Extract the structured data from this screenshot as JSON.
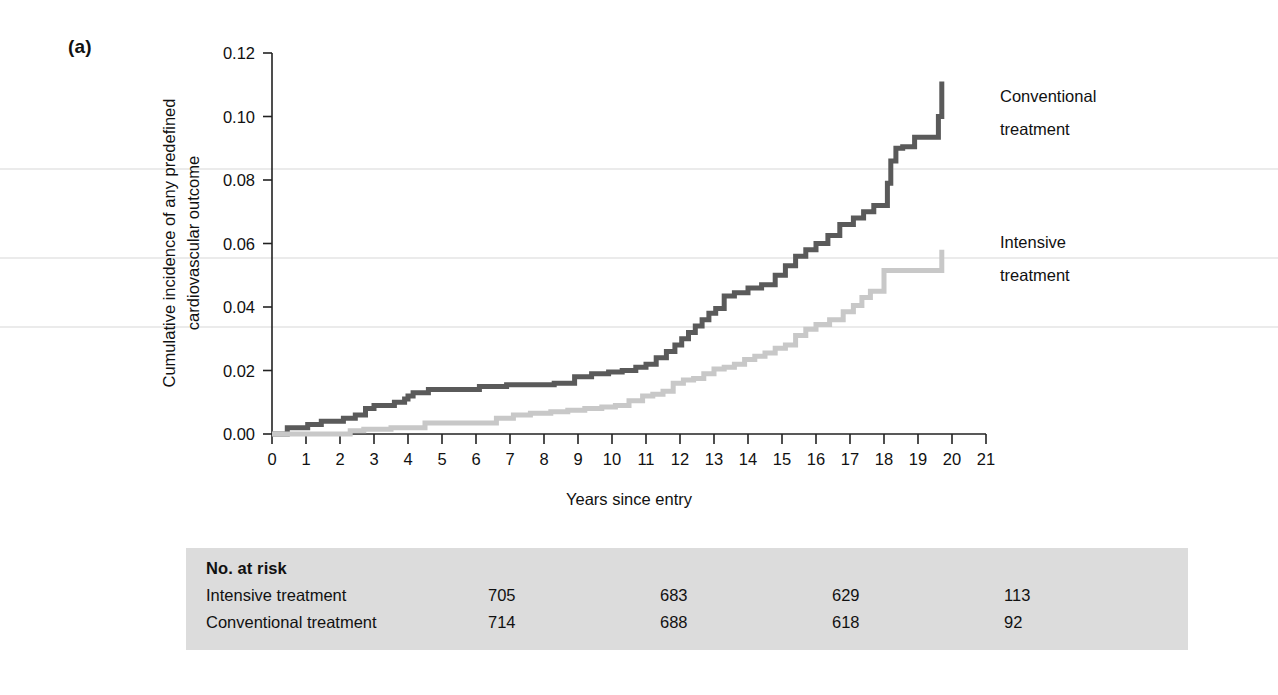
{
  "figure": {
    "panel_label": "(a)",
    "background_color": "#ffffff"
  },
  "chart_data": {
    "type": "line",
    "subtype": "cumulative-incidence-step",
    "title": "",
    "xlabel": "Years since entry",
    "ylabel": "Cumulative incidence of any predefined cardiovascular outcome",
    "ylabel_line1": "Cumulative incidence of any predefined",
    "ylabel_line2": "cardiovascular outcome",
    "xlim": [
      0,
      21
    ],
    "ylim": [
      0.0,
      0.12
    ],
    "xticks": [
      0,
      1,
      2,
      3,
      4,
      5,
      6,
      7,
      8,
      9,
      10,
      11,
      12,
      13,
      14,
      15,
      16,
      17,
      18,
      19,
      20,
      21
    ],
    "xtick_labels": [
      "0",
      "1",
      "2",
      "3",
      "4",
      "5",
      "6",
      "7",
      "8",
      "9",
      "10",
      "11",
      "12",
      "13",
      "14",
      "15",
      "16",
      "17",
      "18",
      "19",
      "20",
      "21"
    ],
    "yticks": [
      0.0,
      0.02,
      0.04,
      0.06,
      0.08,
      0.1,
      0.12
    ],
    "ytick_labels": [
      "0.00",
      "0.02",
      "0.04",
      "0.06",
      "0.08",
      "0.10",
      "0.12"
    ],
    "grid": false,
    "legend_position": "right-inline-annotations",
    "series": [
      {
        "name": "Conventional treatment",
        "color": "#5a5a5a",
        "annotation_line1": "Conventional",
        "annotation_line2": "treatment",
        "final_value": 0.111,
        "x": [
          0.0,
          0.45,
          0.75,
          1.05,
          1.45,
          1.8,
          2.1,
          2.45,
          2.75,
          3.0,
          3.3,
          3.6,
          3.9,
          4.0,
          4.15,
          4.35,
          4.6,
          5.4,
          6.1,
          6.9,
          7.5,
          8.3,
          8.9,
          9.4,
          9.9,
          10.3,
          10.7,
          11.0,
          11.3,
          11.6,
          11.85,
          12.05,
          12.25,
          12.45,
          12.65,
          12.85,
          13.05,
          13.3,
          13.6,
          14.0,
          14.4,
          14.8,
          15.1,
          15.4,
          15.7,
          16.0,
          16.35,
          16.7,
          17.1,
          17.4,
          17.7,
          17.95,
          18.1,
          18.2,
          18.35,
          18.55,
          18.9,
          19.4,
          19.6,
          19.7
        ],
        "y": [
          0.0,
          0.002,
          0.002,
          0.003,
          0.004,
          0.004,
          0.005,
          0.006,
          0.008,
          0.009,
          0.009,
          0.01,
          0.011,
          0.012,
          0.013,
          0.013,
          0.014,
          0.014,
          0.015,
          0.0155,
          0.0155,
          0.016,
          0.018,
          0.019,
          0.0195,
          0.02,
          0.021,
          0.022,
          0.024,
          0.026,
          0.028,
          0.03,
          0.032,
          0.034,
          0.036,
          0.038,
          0.0395,
          0.0435,
          0.0445,
          0.046,
          0.047,
          0.05,
          0.053,
          0.056,
          0.058,
          0.06,
          0.0625,
          0.066,
          0.068,
          0.07,
          0.072,
          0.072,
          0.079,
          0.086,
          0.09,
          0.0905,
          0.0935,
          0.0935,
          0.1,
          0.111
        ]
      },
      {
        "name": "Intensive treatment",
        "color": "#c8c8c8",
        "annotation_line1": "Intensive",
        "annotation_line2": "treatment",
        "final_value": 0.058,
        "x": [
          0.0,
          1.9,
          2.3,
          2.7,
          3.5,
          4.1,
          4.5,
          6.3,
          6.6,
          7.1,
          7.6,
          8.2,
          8.7,
          9.2,
          9.7,
          10.1,
          10.5,
          10.9,
          11.2,
          11.5,
          11.8,
          12.1,
          12.4,
          12.7,
          13.0,
          13.3,
          13.6,
          13.9,
          14.2,
          14.5,
          14.8,
          15.1,
          15.4,
          15.7,
          16.0,
          16.4,
          16.8,
          17.1,
          17.35,
          17.6,
          17.85,
          18.0,
          19.55,
          19.7
        ],
        "y": [
          0.0,
          0.0,
          0.001,
          0.0015,
          0.002,
          0.002,
          0.0035,
          0.0035,
          0.005,
          0.006,
          0.0065,
          0.007,
          0.0075,
          0.008,
          0.0085,
          0.009,
          0.0105,
          0.012,
          0.0125,
          0.0135,
          0.016,
          0.017,
          0.0175,
          0.019,
          0.0205,
          0.021,
          0.022,
          0.0235,
          0.0245,
          0.0255,
          0.027,
          0.028,
          0.031,
          0.033,
          0.0345,
          0.036,
          0.0385,
          0.0405,
          0.043,
          0.045,
          0.045,
          0.0515,
          0.0515,
          0.058
        ]
      }
    ]
  },
  "risk_table": {
    "title": "No. at risk",
    "background_color": "#dcdcdc",
    "rows": [
      {
        "label": "Intensive treatment",
        "values": [
          "705",
          "683",
          "629",
          "113"
        ]
      },
      {
        "label": "Conventional treatment",
        "values": [
          "714",
          "688",
          "618",
          "92"
        ]
      }
    ]
  }
}
